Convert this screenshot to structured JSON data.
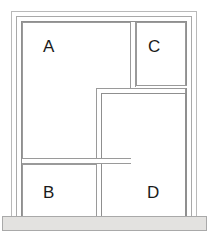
{
  "diagram": {
    "type": "window-elevation",
    "frame": {
      "rings": [
        {
          "name": "outer-casing",
          "color": "#b9b9b9"
        },
        {
          "name": "middle-casing",
          "color": "#a9a9a9"
        },
        {
          "name": "inner-casing",
          "color": "#8f8f8f"
        }
      ],
      "glass_color": "#ffffff",
      "muntin_color": "#9a9a9a",
      "background_color": "#ffffff"
    },
    "sill": {
      "name": "window-sill",
      "color": "#e3e2e0",
      "border_color": "#a9a9a9"
    },
    "panes": [
      {
        "id": "A",
        "label": "A",
        "position": "top-left",
        "shape": "large-fixed-lite"
      },
      {
        "id": "B",
        "label": "B",
        "position": "bottom-left",
        "shape": "small-fixed-lite"
      },
      {
        "id": "C",
        "label": "C",
        "position": "top-right",
        "shape": "small-fixed-lite"
      },
      {
        "id": "D",
        "label": "D",
        "position": "bottom-right",
        "shape": "tall-operable-sash"
      }
    ],
    "dividers": [
      {
        "name": "mullion-a-c",
        "orientation": "vertical",
        "style": "double-line"
      },
      {
        "name": "transom-a-b",
        "orientation": "horizontal",
        "style": "double-line"
      },
      {
        "name": "transom-c-bottom",
        "orientation": "horizontal",
        "style": "single-line"
      }
    ]
  }
}
